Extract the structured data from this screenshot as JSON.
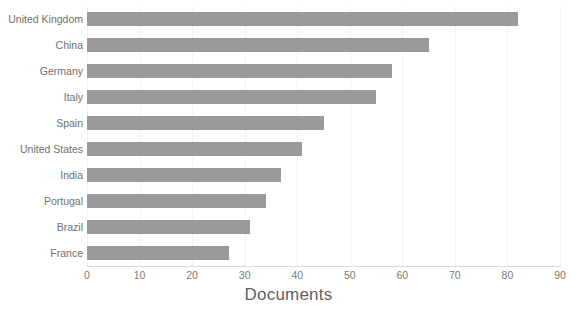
{
  "chart_data": {
    "type": "bar",
    "orientation": "horizontal",
    "title": "",
    "xlabel": "Documents",
    "ylabel": "",
    "categories": [
      "United Kingdom",
      "China",
      "Germany",
      "Italy",
      "Spain",
      "United States",
      "India",
      "Portugal",
      "Brazil",
      "France"
    ],
    "values": [
      82,
      65,
      58,
      55,
      45,
      41,
      37,
      34,
      31,
      27
    ],
    "xlim": [
      0,
      90
    ],
    "xticks": [
      0,
      10,
      20,
      30,
      40,
      50,
      60,
      70,
      80,
      90
    ],
    "xtick_labels": [
      "0",
      "10",
      "20",
      "30",
      "40",
      "50",
      "60",
      "70",
      "80",
      "90"
    ],
    "grid": true,
    "grid_axis": "x",
    "legend": false,
    "bar_color": "#9a9a9a",
    "gridline_color": "#f2f2f2",
    "axis_line_color": "#d9d9d9",
    "tick_label_color": "#7a7a7a",
    "category_label_color": "#6f6f6f",
    "axis_title_color": "#5f5f5f",
    "background_color": "#ffffff"
  }
}
